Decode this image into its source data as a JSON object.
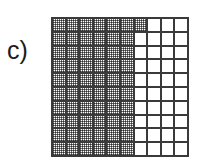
{
  "figure": {
    "panel_label": "c)",
    "background_color": "#ffffff",
    "line_color": "#3a3a3a",
    "shade_color": "#808080",
    "empty_color": "#ffffff"
  },
  "chart_data": {
    "type": "heatmap",
    "title": "c)",
    "subtitle": "",
    "xlabel": "",
    "ylabel": "",
    "legend": [],
    "annotations": [],
    "grid": true,
    "rows": 10,
    "cols": 10,
    "row_labels": [
      "1",
      "2",
      "3",
      "4",
      "5",
      "6",
      "7",
      "8",
      "9",
      "10"
    ],
    "col_labels": [
      "1",
      "2",
      "3",
      "4",
      "5",
      "6",
      "7",
      "8",
      "9",
      "10"
    ],
    "value_legend": {
      "0": "empty",
      "1": "shaded"
    },
    "shaded_count_per_row": [
      7,
      6,
      6,
      6,
      6,
      6,
      6,
      6,
      6,
      6
    ],
    "total_shaded": 61,
    "total_cells": 100,
    "values": [
      [
        1,
        1,
        1,
        1,
        1,
        1,
        1,
        0,
        0,
        0
      ],
      [
        1,
        1,
        1,
        1,
        1,
        1,
        0,
        0,
        0,
        0
      ],
      [
        1,
        1,
        1,
        1,
        1,
        1,
        0,
        0,
        0,
        0
      ],
      [
        1,
        1,
        1,
        1,
        1,
        1,
        0,
        0,
        0,
        0
      ],
      [
        1,
        1,
        1,
        1,
        1,
        1,
        0,
        0,
        0,
        0
      ],
      [
        1,
        1,
        1,
        1,
        1,
        1,
        0,
        0,
        0,
        0
      ],
      [
        1,
        1,
        1,
        1,
        1,
        1,
        0,
        0,
        0,
        0
      ],
      [
        1,
        1,
        1,
        1,
        1,
        1,
        0,
        0,
        0,
        0
      ],
      [
        1,
        1,
        1,
        1,
        1,
        1,
        0,
        0,
        0,
        0
      ],
      [
        1,
        1,
        1,
        1,
        1,
        1,
        0,
        0,
        0,
        0
      ]
    ]
  }
}
